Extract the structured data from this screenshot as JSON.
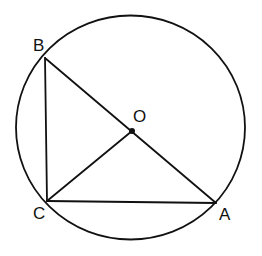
{
  "diagram": {
    "type": "geometry",
    "colors": {
      "stroke": "#111111",
      "background": "#ffffff"
    },
    "circle": {
      "center": "O",
      "cx": 130.5,
      "cy": 127.5,
      "rx": 114.5,
      "ry": 112
    },
    "points": [
      {
        "name": "A",
        "x": 216,
        "y": 203,
        "label": "A",
        "label_x": 219,
        "label_y": 220
      },
      {
        "name": "B",
        "x": 45,
        "y": 58,
        "label": "B",
        "label_x": 33,
        "label_y": 51
      },
      {
        "name": "C",
        "x": 47,
        "y": 201,
        "label": "C",
        "label_x": 33,
        "label_y": 219
      },
      {
        "name": "O",
        "x": 132,
        "y": 131,
        "label": "O",
        "label_x": 133,
        "label_y": 122
      }
    ],
    "segments": [
      [
        "A",
        "B"
      ],
      [
        "B",
        "C"
      ],
      [
        "C",
        "A"
      ],
      [
        "C",
        "O"
      ]
    ]
  }
}
